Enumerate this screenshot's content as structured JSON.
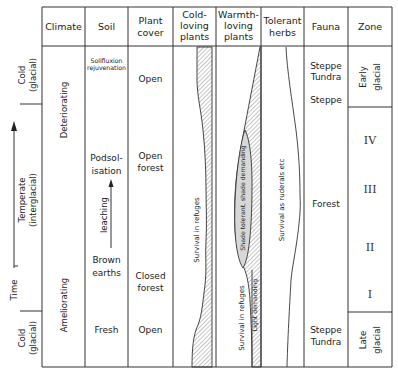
{
  "diagram": {
    "headers": {
      "climate": "Climate",
      "soil": "Soil",
      "plant_cover": [
        "Plant",
        "cover"
      ],
      "cold_loving": [
        "Cold-",
        "loving",
        "plants"
      ],
      "warmth_loving": [
        "Warmth-",
        "loving",
        "plants"
      ],
      "tolerant_herbs": [
        "Tolerant",
        "herbs"
      ],
      "fauna": "Fauna",
      "zone": "Zone"
    },
    "time_axis": {
      "label": "Time",
      "phases": [
        {
          "line1": "Cold",
          "line2": "(glacial)"
        },
        {
          "line1": "Temperate",
          "line2": "(interglacial)"
        },
        {
          "line1": "Cold",
          "line2": "(glacial)"
        }
      ]
    },
    "climate": {
      "upper": "Deteriorating",
      "lower": "Ameliorating"
    },
    "soil": {
      "solifluxion": [
        "Solifluxion",
        "rejuvenation"
      ],
      "podsolisation": [
        "Podsol-",
        "isation"
      ],
      "leaching": "leaching",
      "brown_earths": [
        "Brown",
        "earths"
      ],
      "fresh": "Fresh"
    },
    "plant_cover": {
      "open_top": "Open",
      "open_forest": [
        "Open",
        "forest"
      ],
      "closed_forest": [
        "Closed",
        "forest"
      ],
      "open_bottom": "Open"
    },
    "cold_loving": {
      "label": "Survival in refuges"
    },
    "warmth_loving": {
      "shade": "Shade tolerant, shade demanding",
      "refuges": "Survival in refuges",
      "light": "Light demanding"
    },
    "tolerant_herbs": {
      "label": "Survival as ruderals etc"
    },
    "fauna": {
      "steppe_tundra_top": [
        "Steppe",
        "Tundra"
      ],
      "steppe": "Steppe",
      "forest": "Forest",
      "steppe_tundra_bottom": [
        "Steppe",
        "Tundra"
      ]
    },
    "zone": {
      "early_glacial": [
        "Early",
        "glacial"
      ],
      "substages": [
        "IV",
        "III",
        "II",
        "I"
      ],
      "late_glacial": [
        "Late",
        "glacial"
      ]
    }
  },
  "colors": {
    "line": "#333333",
    "hatch": "#555555",
    "shade_fill": "#d8d8d8"
  }
}
